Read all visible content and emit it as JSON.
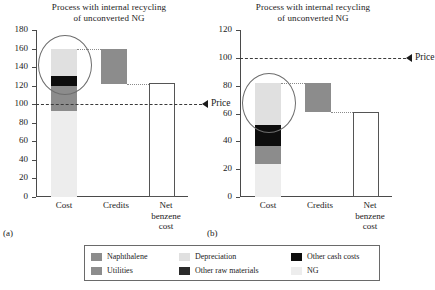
{
  "figure": {
    "panels": [
      {
        "letter": "(a)",
        "title_line1": "Process with internal recycling",
        "title_line2": "of unconverted NG",
        "price_label": "Price"
      },
      {
        "letter": "(b)",
        "title_line1": "Process with internal recycling",
        "title_line2": "of unconverted NG",
        "price_label": "Price"
      }
    ]
  },
  "legend": {
    "items": [
      {
        "label": "Naphthalene",
        "color": "#8c8c8c",
        "swatch_name": "legend-swatch-naphthalene"
      },
      {
        "label": "Depreciation",
        "color": "#e0e0e0",
        "swatch_name": "legend-swatch-depreciation"
      },
      {
        "label": "Other cash costs",
        "color": "#0d0d0d",
        "swatch_name": "legend-swatch-other-cash-costs"
      },
      {
        "label": "Utilities",
        "color": "#8c8c8c",
        "swatch_name": "legend-swatch-utilities"
      },
      {
        "label": "Other raw materials",
        "color": "#2b2b2b",
        "swatch_name": "legend-swatch-other-raw-materials"
      },
      {
        "label": "NG",
        "color": "#ededed",
        "swatch_name": "legend-swatch-ng"
      }
    ]
  },
  "chart_data": [
    {
      "type": "bar",
      "panel": "(a)",
      "title": "Process with internal recycling of unconverted NG",
      "xlabel": "",
      "ylabel": "",
      "ylim": [
        0,
        180
      ],
      "yticks": [
        0,
        20,
        40,
        60,
        80,
        100,
        120,
        140,
        160,
        180
      ],
      "grid": false,
      "legend_position": "below-figure",
      "categories": [
        "Cost",
        "Credits",
        "Net benzene cost"
      ],
      "stacked_series": [
        {
          "name": "NG",
          "base": 0,
          "top": 93,
          "value": 93,
          "color": "#ededed"
        },
        {
          "name": "Utilities",
          "base": 93,
          "top": 120,
          "value": 27,
          "color": "#8c8c8c"
        },
        {
          "name": "Other cash costs",
          "base": 120,
          "top": 130,
          "value": 10,
          "color": "#0d0d0d"
        },
        {
          "name": "Depreciation",
          "base": 130,
          "top": 160,
          "value": 30,
          "color": "#e0e0e0"
        }
      ],
      "bars": [
        {
          "category": "Cost",
          "base": 0,
          "top": 160,
          "value": 160,
          "style": "stacked"
        },
        {
          "category": "Credits",
          "base": 122,
          "top": 160,
          "value": 38,
          "style": "floating",
          "color": "#8c8c8c"
        },
        {
          "category": "Net benzene cost",
          "base": 0,
          "top": 123,
          "value": 123,
          "style": "hollow",
          "color": "#ffffff"
        }
      ],
      "annotations": [
        {
          "name": "price-line",
          "type": "hline",
          "value": 100,
          "label": "Price",
          "style": "dashed"
        },
        {
          "name": "highlight-circle",
          "type": "ellipse",
          "center_category": "Cost",
          "center_value": 143
        }
      ]
    },
    {
      "type": "bar",
      "panel": "(b)",
      "title": "Process with internal recycling of unconverted NG",
      "xlabel": "",
      "ylabel": "",
      "ylim": [
        0,
        120
      ],
      "yticks": [
        0,
        20,
        40,
        60,
        80,
        100,
        120
      ],
      "grid": false,
      "legend_position": "below-figure",
      "categories": [
        "Cost",
        "Credits",
        "Net benzene cost"
      ],
      "stacked_series": [
        {
          "name": "NG",
          "base": 0,
          "top": 24,
          "value": 24,
          "color": "#ededed"
        },
        {
          "name": "Utilities",
          "base": 24,
          "top": 37,
          "value": 13,
          "color": "#8c8c8c"
        },
        {
          "name": "Other cash costs",
          "base": 37,
          "top": 52,
          "value": 15,
          "color": "#0d0d0d"
        },
        {
          "name": "Depreciation",
          "base": 52,
          "top": 82,
          "value": 30,
          "color": "#e0e0e0"
        }
      ],
      "bars": [
        {
          "category": "Cost",
          "base": 0,
          "top": 82,
          "value": 82,
          "style": "stacked"
        },
        {
          "category": "Credits",
          "base": 61,
          "top": 82,
          "value": 21,
          "style": "floating",
          "color": "#8c8c8c"
        },
        {
          "category": "Net benzene cost",
          "base": 0,
          "top": 61,
          "value": 61,
          "style": "hollow",
          "color": "#ffffff"
        }
      ],
      "annotations": [
        {
          "name": "price-line",
          "type": "hline",
          "value": 100,
          "label": "Price",
          "style": "dashed"
        },
        {
          "name": "highlight-circle",
          "type": "ellipse",
          "center_category": "Cost",
          "center_value": 68
        }
      ]
    }
  ],
  "axis_labels": {
    "cost": "Cost",
    "credits": "Credits",
    "net_line1": "Net",
    "net_line2": "benzene",
    "net_line3": "cost"
  }
}
